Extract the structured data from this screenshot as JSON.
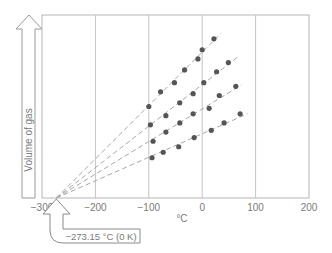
{
  "chart_data": {
    "type": "scatter",
    "title": "",
    "xlabel": "°C",
    "ylabel": "Volume of gas",
    "xlim": [
      -300,
      200
    ],
    "x_ticks": [
      -300,
      -200,
      -100,
      0,
      100,
      200
    ],
    "x_tick_labels": [
      "−300",
      "−200",
      "−100",
      "0",
      "100",
      "200"
    ],
    "grid": {
      "vertical": true,
      "horizontal": false
    },
    "legend": null,
    "y_units": "relative (no numeric scale shown)",
    "extrapolation_point": {
      "x": -273.15,
      "y": 0
    },
    "annotation": "−273.15 °C (0 K)",
    "series": [
      {
        "name": "gas sample 1",
        "x": [
          -100,
          -78,
          -52,
          -33,
          -8,
          0,
          22
        ],
        "y": [
          0.5,
          0.58,
          0.63,
          0.7,
          0.76,
          0.81,
          0.87
        ],
        "fit_end_x": 35
      },
      {
        "name": "gas sample 2",
        "x": [
          -97,
          -68,
          -42,
          -17,
          3,
          27,
          49
        ],
        "y": [
          0.4,
          0.45,
          0.52,
          0.57,
          0.63,
          0.69,
          0.74
        ],
        "fit_end_x": 68
      },
      {
        "name": "gas sample 3",
        "x": [
          -92,
          -68,
          -42,
          -17,
          13,
          32,
          63
        ],
        "y": [
          0.31,
          0.36,
          0.41,
          0.46,
          0.49,
          0.56,
          0.61
        ],
        "fit_end_x": 73
      },
      {
        "name": "gas sample 4",
        "x": [
          -94,
          -73,
          -44,
          -15,
          17,
          41,
          71
        ],
        "y": [
          0.22,
          0.25,
          0.28,
          0.33,
          0.37,
          0.41,
          0.46
        ],
        "fit_end_x": 85
      }
    ]
  },
  "labels": {
    "y_axis": "Volume of gas",
    "x_axis": "°C",
    "callout": "−273.15 °C (0 K)"
  }
}
